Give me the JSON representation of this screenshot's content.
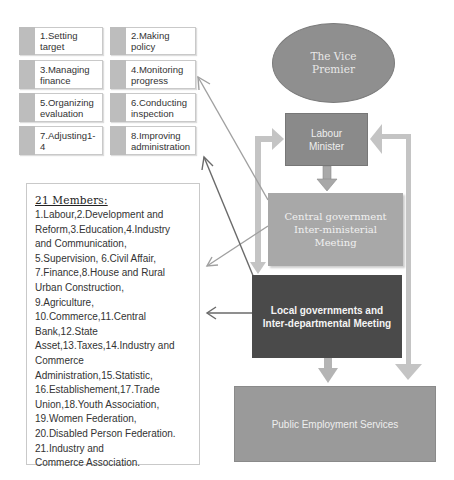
{
  "tasks": [
    {
      "label": "1.Setting target"
    },
    {
      "label": "2.Making policy"
    },
    {
      "label": "3.Managing finance"
    },
    {
      "label": "4.Monitoring progress"
    },
    {
      "label": "5.Organizing evaluation"
    },
    {
      "label": "6.Conducting inspection"
    },
    {
      "label": "7.Adjusting1-4"
    },
    {
      "label": "8.Improving administration"
    }
  ],
  "members": {
    "title": "21 Members:",
    "body": "1.Labour,2.Development and\nReform,3.Education,4.Industry\nand Communication,\n5.Supervision, 6.Civil Affair,\n7.Finance,8.House and Rural\nUrban Construction,\n9.Agriculture,\n10.Commerce,11.Central\nBank,12.State\nAsset,13.Taxes,14.Industry and\nCommerce Administration,15.Statistic,\n16.Establishement,17.Trade\nUnion,18.Youth Association,\n19.Women Federation,\n20.Disabled Person Federation.\n21.Industry and\nCommerce Association."
  },
  "nodes": {
    "vice_premier": "The Vice\nPremier",
    "labour_minister": "Labour\nMinister",
    "central_meeting": "Central government\nInter-ministerial\nMeeting",
    "local_meeting": "Local governments and\nInter-departmental Meeting",
    "public_employment": "Public Employment Services"
  },
  "colors": {
    "ellipse": "#8f8f8f",
    "minister": "#8a8a8a",
    "central": "#a8a8a8",
    "local": "#4a4a4a",
    "pes": "#9a9a9a",
    "arrow_light": "#c4c4c4",
    "arrow_dark": "#6a6a6a"
  }
}
